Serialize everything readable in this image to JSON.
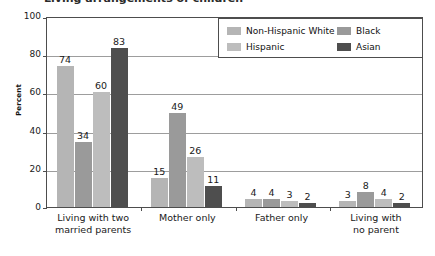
{
  "title_partial": "Living arrangements of children",
  "chart_data": {
    "type": "bar",
    "title": "",
    "xlabel": "",
    "ylabel": "Percent",
    "ylim": [
      0,
      100
    ],
    "yticks": [
      0,
      20,
      40,
      60,
      80,
      100
    ],
    "grid": true,
    "legend_position": "top-right",
    "categories": [
      "Living with two married parents",
      "Mother only",
      "Father only",
      "Living with no parent"
    ],
    "category_lines": [
      [
        "Living with two",
        "married parents"
      ],
      [
        "Mother only",
        ""
      ],
      [
        "Father only",
        ""
      ],
      [
        "Living with",
        "no parent"
      ]
    ],
    "series": [
      {
        "name": "Non-Hispanic White",
        "color": "#b5b5b5",
        "values": [
          74,
          15,
          4,
          3
        ]
      },
      {
        "name": "Hispanic",
        "color": "#9a9a9a",
        "values": [
          34,
          49,
          4,
          8
        ]
      },
      {
        "name": "Black",
        "color": "#bdbdbd",
        "values": [
          60,
          26,
          3,
          4
        ]
      },
      {
        "name": "Asian",
        "color": "#4e4e4e",
        "values": [
          83,
          11,
          2,
          2
        ]
      }
    ],
    "legend_entries": [
      {
        "label": "Non-Hispanic White",
        "color": "#b5b5b5"
      },
      {
        "label": "Hispanic",
        "color": "#bdbdbd"
      },
      {
        "label": "Black",
        "color": "#9a9a9a"
      },
      {
        "label": "Asian",
        "color": "#4e4e4e"
      }
    ]
  }
}
